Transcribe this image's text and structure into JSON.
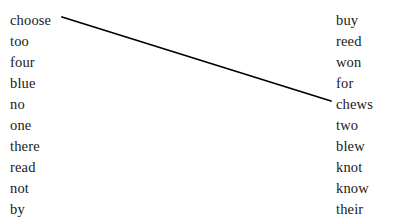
{
  "page": {
    "background_color": "#ffffff",
    "text_color": "#1a1a1a",
    "width": 397,
    "height": 220
  },
  "left_column": {
    "name": "left-word-column",
    "start_x": 10,
    "start_y": 10,
    "line_height": 21,
    "items": [
      {
        "label": "choose"
      },
      {
        "label": "too"
      },
      {
        "label": "four"
      },
      {
        "label": "blue"
      },
      {
        "label": "no"
      },
      {
        "label": "one"
      },
      {
        "label": "there"
      },
      {
        "label": "read"
      },
      {
        "label": "not"
      },
      {
        "label": "by"
      }
    ]
  },
  "right_column": {
    "name": "right-word-column",
    "start_x": 336,
    "start_y": 10,
    "line_height": 21,
    "items": [
      {
        "label": "buy"
      },
      {
        "label": "reed"
      },
      {
        "label": "won"
      },
      {
        "label": "for"
      },
      {
        "label": "chews"
      },
      {
        "label": "two"
      },
      {
        "label": "blew"
      },
      {
        "label": "knot"
      },
      {
        "label": "know"
      },
      {
        "label": "their"
      }
    ]
  },
  "connections": [
    {
      "from": "choose",
      "to": "chews",
      "x1": 62,
      "y1": 17,
      "x2": 331,
      "y2": 101,
      "color": "#000000",
      "width": 1.8
    }
  ]
}
